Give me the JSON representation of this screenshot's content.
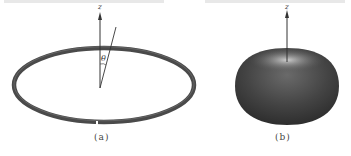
{
  "figure_a": {
    "caption": "(a)",
    "axis_label": "z",
    "angle_label": "θ",
    "description": "loop ring with vertical z-axis and line at angle theta"
  },
  "figure_b": {
    "caption": "(b)",
    "axis_label": "z",
    "description": "doughnut-shaped radiation pattern with z-axis arrow"
  },
  "colors": {
    "ring": "#4a4a4a",
    "solid": "#3c3c3c",
    "highlight": "#b0b0b0",
    "line": "#333333"
  }
}
